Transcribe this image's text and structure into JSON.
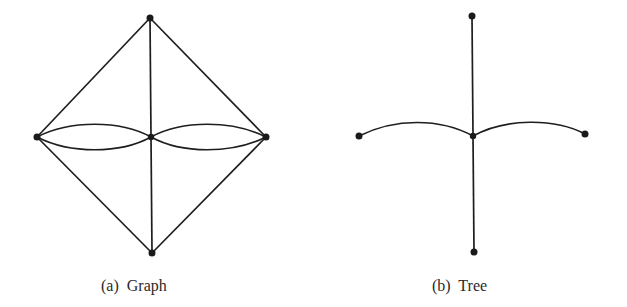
{
  "figures": [
    {
      "id": "a",
      "caption": "(a)  Graph",
      "nodes": [
        {
          "id": "top",
          "x": 150,
          "y": 18
        },
        {
          "id": "left",
          "x": 37,
          "y": 137
        },
        {
          "id": "center",
          "x": 151,
          "y": 137
        },
        {
          "id": "right",
          "x": 266,
          "y": 137
        },
        {
          "id": "bottom",
          "x": 152,
          "y": 253
        }
      ],
      "edges": [
        [
          "top",
          "left"
        ],
        [
          "top",
          "right"
        ],
        [
          "top",
          "center"
        ],
        [
          "bottom",
          "left"
        ],
        [
          "bottom",
          "right"
        ],
        [
          "bottom",
          "center"
        ],
        [
          "left",
          "center",
          "curve-up"
        ],
        [
          "left",
          "center",
          "curve-down"
        ],
        [
          "center",
          "right",
          "curve-up"
        ],
        [
          "center",
          "right",
          "curve-down"
        ]
      ]
    },
    {
      "id": "b",
      "caption": "(b)  Tree",
      "nodes": [
        {
          "id": "top",
          "x": 472,
          "y": 16
        },
        {
          "id": "left",
          "x": 359,
          "y": 136
        },
        {
          "id": "center",
          "x": 473,
          "y": 136
        },
        {
          "id": "right",
          "x": 585,
          "y": 134
        },
        {
          "id": "bottom",
          "x": 474,
          "y": 252
        }
      ],
      "edges": [
        [
          "top",
          "center"
        ],
        [
          "center",
          "bottom"
        ],
        [
          "left",
          "center",
          "curve-up"
        ],
        [
          "center",
          "right",
          "curve-up"
        ]
      ]
    }
  ],
  "colors": {
    "line": "#1e1e1e",
    "node": "#1a1a1a",
    "background": "#ffffff"
  }
}
